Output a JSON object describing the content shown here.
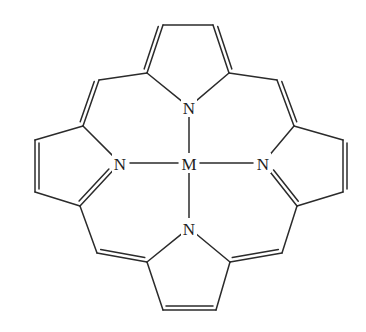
{
  "diagram": {
    "type": "chemical-structure",
    "line_color": "#2b2b2b",
    "background": "#ffffff",
    "atoms": [
      {
        "id": "M",
        "label": "M",
        "x": 189,
        "y": 163
      },
      {
        "id": "N1",
        "label": "N",
        "x": 189,
        "y": 107
      },
      {
        "id": "N2",
        "label": "N",
        "x": 120,
        "y": 163
      },
      {
        "id": "N3",
        "label": "N",
        "x": 263,
        "y": 163
      },
      {
        "id": "N4",
        "label": "N",
        "x": 189,
        "y": 228
      }
    ],
    "carbons": {
      "t_ab1": [
        163,
        25
      ],
      "t_ab2": [
        213,
        25
      ],
      "t_aa1": [
        147,
        73
      ],
      "t_aa2": [
        229,
        73
      ],
      "m_tl": [
        99,
        80
      ],
      "m_tr": [
        277,
        80
      ],
      "l_a1": [
        83,
        126
      ],
      "l_b1": [
        35,
        140
      ],
      "l_b2": [
        35,
        192
      ],
      "l_a2": [
        80,
        206
      ],
      "r_a1": [
        294,
        126
      ],
      "r_b1": [
        343,
        140
      ],
      "r_b2": [
        343,
        192
      ],
      "r_a2": [
        297,
        206
      ],
      "m_bl": [
        97,
        253
      ],
      "m_br": [
        282,
        253
      ],
      "b_a1": [
        147,
        262
      ],
      "b_a2": [
        230,
        262
      ],
      "b_b1": [
        163,
        310
      ],
      "b_b2": [
        216,
        310
      ]
    },
    "labels": {
      "metal": "M",
      "n_top": "N",
      "n_left": "N",
      "n_right": "N",
      "n_bottom": "N"
    }
  }
}
